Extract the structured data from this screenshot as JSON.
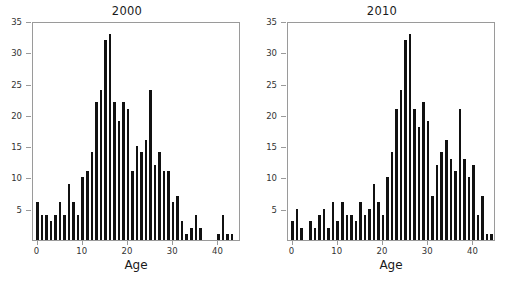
{
  "figure": {
    "background": "#ffffff",
    "bar_color": "#111111",
    "axis_color": "#9a9a9a",
    "text_color": "#333333"
  },
  "panels": [
    {
      "title": "2000",
      "xlabel": "Age"
    },
    {
      "title": "2010",
      "xlabel": "Age"
    }
  ],
  "chart_data": [
    {
      "type": "bar",
      "title": "2000",
      "xlabel": "Age",
      "ylabel": "",
      "xlim": [
        -1,
        45
      ],
      "ylim": [
        0,
        35
      ],
      "xticks": [
        0,
        10,
        20,
        30,
        40
      ],
      "yticks": [
        5,
        10,
        15,
        20,
        25,
        30,
        35
      ],
      "grid": false,
      "legend": null,
      "categories": [
        0,
        1,
        2,
        3,
        4,
        5,
        6,
        7,
        8,
        9,
        10,
        11,
        12,
        13,
        14,
        15,
        16,
        17,
        18,
        19,
        20,
        21,
        22,
        23,
        24,
        25,
        26,
        27,
        28,
        29,
        30,
        31,
        32,
        33,
        34,
        35,
        36,
        37,
        38,
        39,
        40,
        41,
        42,
        43,
        44
      ],
      "values": [
        6,
        4,
        4,
        3,
        4,
        6,
        4,
        9,
        6,
        4,
        10,
        11,
        14,
        22,
        24,
        32,
        33,
        22,
        19,
        22,
        21,
        11,
        15,
        14,
        16,
        24,
        12,
        14,
        11,
        11,
        6,
        7,
        3,
        1,
        2,
        4,
        2,
        0,
        0,
        0,
        1,
        4,
        1,
        1,
        0
      ]
    },
    {
      "type": "bar",
      "title": "2010",
      "xlabel": "Age",
      "ylabel": "",
      "xlim": [
        -1,
        45
      ],
      "ylim": [
        0,
        35
      ],
      "xticks": [
        0,
        10,
        20,
        30,
        40
      ],
      "yticks": [
        5,
        10,
        15,
        20,
        25,
        30,
        35
      ],
      "grid": false,
      "legend": null,
      "categories": [
        0,
        1,
        2,
        3,
        4,
        5,
        6,
        7,
        8,
        9,
        10,
        11,
        12,
        13,
        14,
        15,
        16,
        17,
        18,
        19,
        20,
        21,
        22,
        23,
        24,
        25,
        26,
        27,
        28,
        29,
        30,
        31,
        32,
        33,
        34,
        35,
        36,
        37,
        38,
        39,
        40,
        41,
        42,
        43,
        44
      ],
      "values": [
        3,
        5,
        2,
        0,
        3,
        2,
        4,
        5,
        2,
        6,
        3,
        6,
        4,
        4,
        3,
        6,
        4,
        5,
        9,
        6,
        4,
        10,
        14,
        21,
        24,
        32,
        33,
        21,
        18,
        22,
        19,
        7,
        12,
        14,
        16,
        13,
        11,
        21,
        13,
        10,
        12,
        4,
        7,
        1,
        1
      ]
    }
  ]
}
